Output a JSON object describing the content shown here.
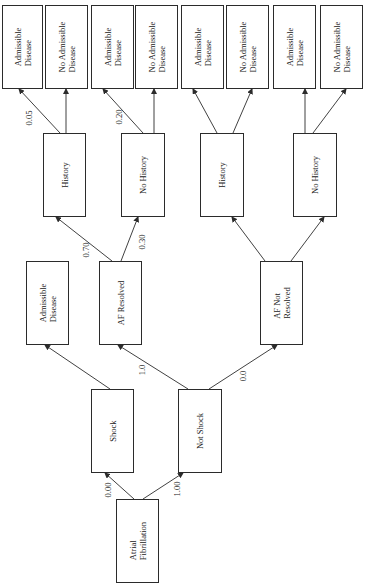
{
  "diagram": {
    "type": "decision-tree",
    "orientation": "rotated-90-ccw",
    "nodes": {
      "root": {
        "lines": [
          "Atrial",
          "Fibrillation"
        ]
      },
      "shock": {
        "lines": [
          "Shock"
        ]
      },
      "not_shock": {
        "lines": [
          "Not Shock"
        ]
      },
      "shock_outcome": {
        "lines": [
          "Admissible",
          "Disease"
        ]
      },
      "af_resolved": {
        "lines": [
          "AF Resolved"
        ]
      },
      "af_not_resolved": {
        "lines": [
          "AF Not",
          "Resolved"
        ]
      },
      "res_history": {
        "lines": [
          "History"
        ]
      },
      "res_no_history": {
        "lines": [
          "No History"
        ]
      },
      "nres_history": {
        "lines": [
          "History"
        ]
      },
      "nres_no_history": {
        "lines": [
          "No History"
        ]
      },
      "leaf1": {
        "lines": [
          "Admissible",
          "Disease"
        ]
      },
      "leaf2": {
        "lines": [
          "No Admissible",
          "Disease"
        ]
      },
      "leaf3": {
        "lines": [
          "Admissible",
          "Disease"
        ]
      },
      "leaf4": {
        "lines": [
          "No Admissible",
          "Disease"
        ]
      },
      "leaf5": {
        "lines": [
          "Admissible",
          "Disease"
        ]
      },
      "leaf6": {
        "lines": [
          "No Admissible",
          "Disease"
        ]
      },
      "leaf7": {
        "lines": [
          "Admissible",
          "Disease"
        ]
      },
      "leaf8": {
        "lines": [
          "No Admissible",
          "Disease"
        ]
      }
    },
    "edge_labels": {
      "root_to_shock": "0.00",
      "root_to_not_shock": "1.00",
      "not_shock_to_af_resolved": "1.0",
      "not_shock_to_af_not_resolved": "0.0",
      "af_resolved_to_history": "0.70",
      "af_resolved_to_no_history": "0.30",
      "history_to_admissible": "0.05",
      "no_history_to_admissible": "0.20"
    },
    "edges": [
      [
        "root",
        "shock"
      ],
      [
        "root",
        "not_shock"
      ],
      [
        "shock",
        "shock_outcome"
      ],
      [
        "not_shock",
        "af_resolved"
      ],
      [
        "not_shock",
        "af_not_resolved"
      ],
      [
        "af_resolved",
        "res_history"
      ],
      [
        "af_resolved",
        "res_no_history"
      ],
      [
        "af_not_resolved",
        "nres_history"
      ],
      [
        "af_not_resolved",
        "nres_no_history"
      ],
      [
        "res_history",
        "leaf1"
      ],
      [
        "res_history",
        "leaf2"
      ],
      [
        "res_no_history",
        "leaf3"
      ],
      [
        "res_no_history",
        "leaf4"
      ],
      [
        "nres_history",
        "leaf5"
      ],
      [
        "nres_history",
        "leaf6"
      ],
      [
        "nres_no_history",
        "leaf7"
      ],
      [
        "nres_no_history",
        "leaf8"
      ]
    ],
    "colors": {
      "line": "#2b2b2b",
      "background": "#ffffff",
      "text": "#222222"
    }
  }
}
